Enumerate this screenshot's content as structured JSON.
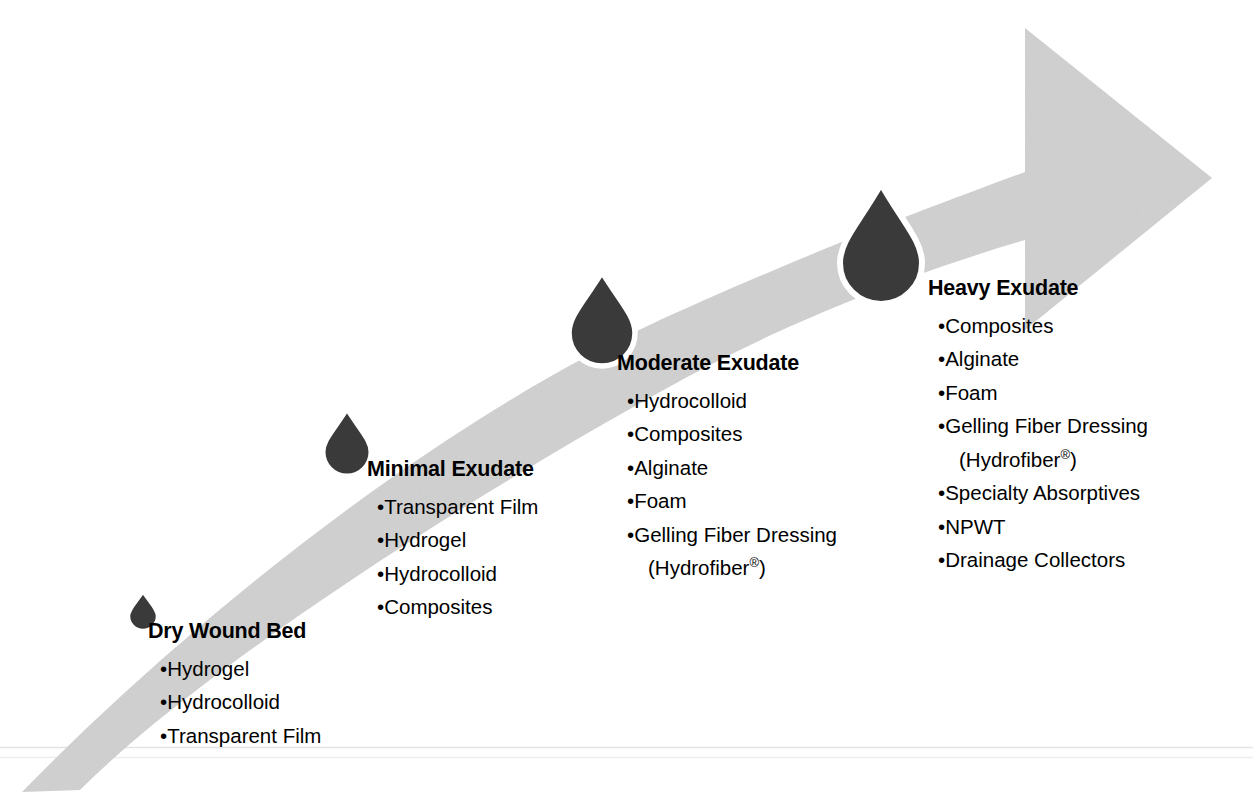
{
  "figure": {
    "arrow_color": "#d0d0d0",
    "droplet_color": "#3a3a3a",
    "droplet_outline_color": "#ffffff",
    "baseline_rule_color": "#e2e2e2",
    "text_color": "#000000"
  },
  "stages": [
    {
      "id": "dry-wound-bed",
      "heading": "Dry Wound Bed",
      "droplet_name": "droplet-smallest",
      "items": [
        {
          "text": "Hydrogel"
        },
        {
          "text": "Hydrocolloid"
        },
        {
          "text": "Transparent Film"
        }
      ]
    },
    {
      "id": "minimal-exudate",
      "heading": "Minimal Exudate",
      "droplet_name": "droplet-small",
      "items": [
        {
          "text": "Transparent Film"
        },
        {
          "text": "Hydrogel"
        },
        {
          "text": "Hydrocolloid"
        },
        {
          "text": "Composites"
        }
      ]
    },
    {
      "id": "moderate-exudate",
      "heading": "Moderate Exudate",
      "droplet_name": "droplet-medium",
      "items": [
        {
          "text": "Hydrocolloid"
        },
        {
          "text": "Composites"
        },
        {
          "text": "Alginate"
        },
        {
          "text": "Foam"
        },
        {
          "text": "Gelling Fiber Dressing",
          "sub": "(Hydrofiber®)"
        }
      ]
    },
    {
      "id": "heavy-exudate",
      "heading": "Heavy Exudate",
      "droplet_name": "droplet-large",
      "items": [
        {
          "text": "Composites"
        },
        {
          "text": "Alginate"
        },
        {
          "text": "Foam"
        },
        {
          "text": "Gelling Fiber Dressing",
          "sub": "(Hydrofiber®)"
        },
        {
          "text": "Specialty Absorptives"
        },
        {
          "text": "NPWT"
        },
        {
          "text": "Drainage Collectors"
        }
      ]
    }
  ],
  "bullet_glyph": "•"
}
